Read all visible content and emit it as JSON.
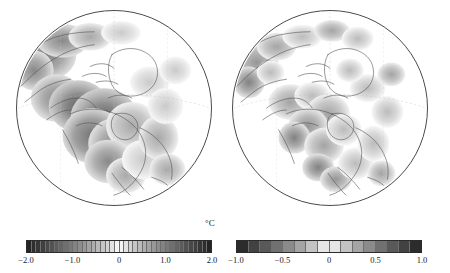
{
  "figure": {
    "units_label": "°C",
    "background": "#ffffff",
    "outline_color": "#4a4a4a"
  },
  "panels": [
    {
      "id": "left",
      "name": "globe-left",
      "projection": "orthographic",
      "center_region": "North America / Arctic",
      "diameter_px": 196
    },
    {
      "id": "right",
      "name": "globe-right",
      "projection": "orthographic",
      "center_region": "North America / Arctic",
      "diameter_px": 196
    }
  ],
  "chart_data": {
    "type": "heatmap",
    "title": "",
    "xlabel": "",
    "ylabel": "",
    "units": "°C",
    "projection": "orthographic",
    "colormap": "diverging-grayscale",
    "colormap_note": "dark at both extremes, white at zero",
    "panels": [
      {
        "name": "left-panel",
        "colorbar": {
          "vmin": -2.0,
          "vmax": 2.0,
          "n_cells": 40,
          "tick_values": [
            -2.0,
            -1.0,
            0,
            1.0,
            2.0
          ],
          "tick_labels": [
            "−2.0",
            "−1.0",
            "0",
            "1.0",
            "2.0"
          ]
        },
        "field_summary": {
          "max_negative_anomaly": -2.0,
          "max_positive_anomaly": 2.0,
          "dominant_sign": "negative",
          "strong_regions": [
            "central North America",
            "northwest Canada",
            "Greenland margin",
            "northern Eurasia"
          ]
        }
      },
      {
        "name": "right-panel",
        "colorbar": {
          "vmin": -1.0,
          "vmax": 1.0,
          "n_cells": 16,
          "tick_values": [
            -1.0,
            -0.5,
            0,
            0.5,
            1.0
          ],
          "tick_labels": [
            "−1.0",
            "−0.5",
            "0",
            "0.5",
            "1.0"
          ]
        },
        "field_summary": {
          "max_negative_anomaly": -1.0,
          "max_positive_anomaly": 1.0,
          "dominant_sign": "mixed",
          "strong_regions": [
            "western North America",
            "Mexico",
            "Arctic Ocean",
            "northern Eurasia"
          ]
        }
      }
    ]
  },
  "colorbars": [
    {
      "id": "left",
      "name": "colorbar-left",
      "vmin": -2.0,
      "vmax": 2.0,
      "n_cells": 40,
      "ticks": [
        {
          "label": "−2.0",
          "value": -2.0
        },
        {
          "label": "−1.0",
          "value": -1.0
        },
        {
          "label": "0",
          "value": 0.0
        },
        {
          "label": "1.0",
          "value": 1.0
        },
        {
          "label": "2.0",
          "value": 2.0
        }
      ]
    },
    {
      "id": "right",
      "name": "colorbar-right",
      "vmin": -1.0,
      "vmax": 1.0,
      "n_cells": 16,
      "ticks": [
        {
          "label": "−1.0",
          "value": -1.0
        },
        {
          "label": "−0.5",
          "value": -0.5
        },
        {
          "label": "0",
          "value": 0.0
        },
        {
          "label": "0.5",
          "value": 0.5
        },
        {
          "label": "1.0",
          "value": 1.0
        }
      ]
    }
  ]
}
